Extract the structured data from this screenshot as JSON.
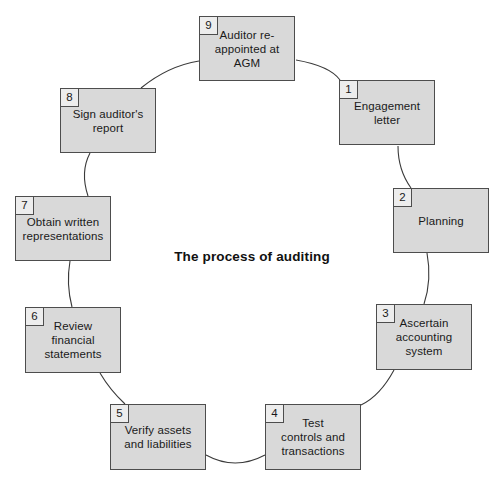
{
  "diagram": {
    "title": "The process of auditing",
    "type": "cycle",
    "colors": {
      "node_fill": "#d9d9d9",
      "node_border": "#4d4d4d",
      "number_tab_fill": "#ededed",
      "arc_stroke": "#3a3a3a",
      "background": "#ffffff",
      "text": "#1a1a1a"
    },
    "nodes": [
      {
        "number": "1",
        "label": "Engagement\nletter",
        "x": 339,
        "y": 80,
        "w": 96,
        "h": 65
      },
      {
        "number": "2",
        "label": "Planning",
        "x": 393,
        "y": 188,
        "w": 96,
        "h": 65
      },
      {
        "number": "3",
        "label": "Ascertain\naccounting\nsystem",
        "x": 376,
        "y": 304,
        "w": 96,
        "h": 66
      },
      {
        "number": "4",
        "label": "Test\ncontrols and\ntransactions",
        "x": 265,
        "y": 404,
        "w": 96,
        "h": 66
      },
      {
        "number": "5",
        "label": "Verify assets\nand liabilities",
        "x": 110,
        "y": 404,
        "w": 96,
        "h": 66
      },
      {
        "number": "6",
        "label": "Review\nfinancial\nstatements",
        "x": 25,
        "y": 307,
        "w": 96,
        "h": 66
      },
      {
        "number": "7",
        "label": "Obtain written\nrepresentations",
        "x": 15,
        "y": 196,
        "w": 96,
        "h": 65
      },
      {
        "number": "8",
        "label": "Sign auditor's\nreport",
        "x": 60,
        "y": 88,
        "w": 96,
        "h": 65
      },
      {
        "number": "9",
        "label": "Auditor re-\nappointed at\nAGM",
        "x": 199,
        "y": 16,
        "w": 96,
        "h": 65
      }
    ],
    "connectors": [
      {
        "from": "9",
        "to": "1"
      },
      {
        "from": "1",
        "to": "2"
      },
      {
        "from": "2",
        "to": "3"
      },
      {
        "from": "3",
        "to": "4"
      },
      {
        "from": "4",
        "to": "5"
      },
      {
        "from": "5",
        "to": "6"
      },
      {
        "from": "6",
        "to": "7"
      },
      {
        "from": "7",
        "to": "8"
      },
      {
        "from": "8",
        "to": "9"
      }
    ]
  }
}
